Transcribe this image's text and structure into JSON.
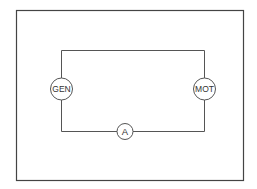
{
  "diagram": {
    "type": "circuit",
    "components": {
      "generator": {
        "label": "GEN"
      },
      "motor": {
        "label": "MOT"
      },
      "ammeter": {
        "label": "A"
      }
    },
    "colors": {
      "line": "#444444",
      "background": "#ffffff"
    }
  }
}
